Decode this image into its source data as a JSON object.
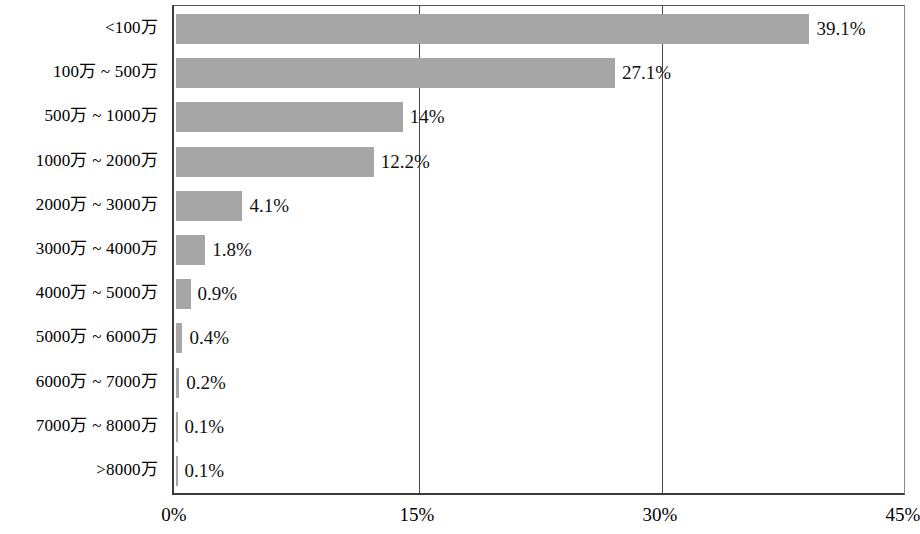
{
  "chart_data": {
    "type": "bar",
    "orientation": "horizontal",
    "title": "",
    "xlabel": "",
    "ylabel": "",
    "xlim": [
      0,
      45
    ],
    "xticks": [
      "0%",
      "15%",
      "30%",
      "45%"
    ],
    "xtick_values": [
      0,
      15,
      30,
      45
    ],
    "grid": "vertical",
    "legend": "none",
    "bar_color": "#a6a6a6",
    "axis_color": "#3a3a3a",
    "categories": [
      "<100万",
      "100万 ~ 500万",
      "500万 ~ 1000万",
      "1000万 ~ 2000万",
      "2000万 ~ 3000万",
      "3000万 ~ 4000万",
      "4000万 ~ 5000万",
      "5000万 ~ 6000万",
      "6000万 ~ 7000万",
      "7000万 ~ 8000万",
      ">8000万"
    ],
    "values": [
      39.1,
      27.1,
      14,
      12.2,
      4.1,
      1.8,
      0.9,
      0.4,
      0.2,
      0.1,
      0.1
    ],
    "data_labels": [
      "39.1%",
      "27.1%",
      "14%",
      "12.2%",
      "4.1%",
      "1.8%",
      "0.9%",
      "0.4%",
      "0.2%",
      "0.1%",
      "0.1%"
    ]
  }
}
